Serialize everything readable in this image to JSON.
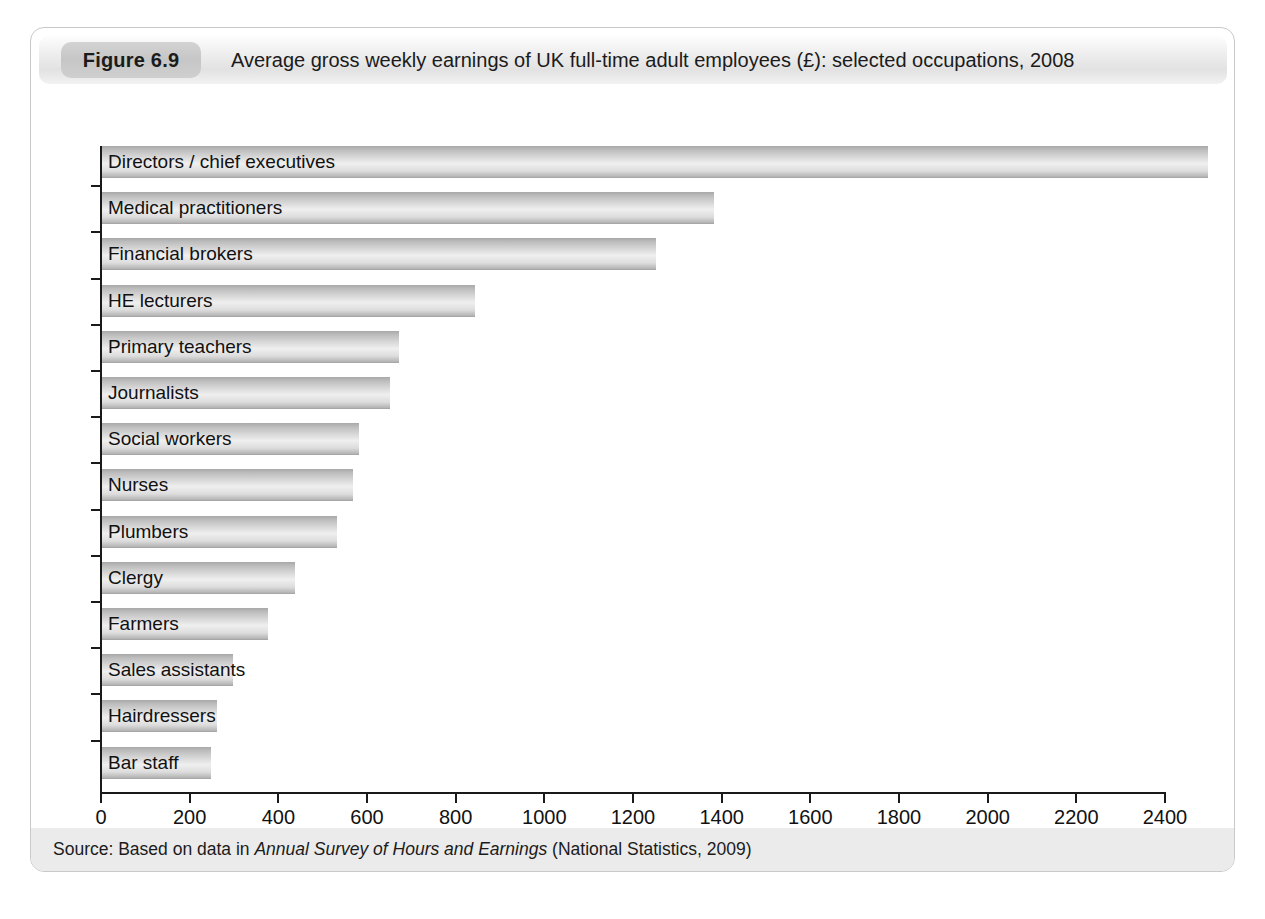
{
  "figure": {
    "number_label": "Figure 6.9",
    "title": "Average gross weekly earnings of UK full-time adult employees (£): selected occupations, 2008",
    "source_prefix": "Source: Based on data in ",
    "source_italic": "Annual Survey of Hours and Earnings",
    "source_suffix": " (National Statistics, 2009)"
  },
  "chart_data": {
    "type": "bar",
    "orientation": "horizontal",
    "title": "Average gross weekly earnings of UK full-time adult employees (£): selected occupations, 2008",
    "xlabel": "",
    "ylabel": "",
    "xlim": [
      0,
      2500
    ],
    "grid": false,
    "legend": "none",
    "xticks": [
      0,
      200,
      400,
      600,
      800,
      1000,
      1200,
      1400,
      1600,
      1800,
      2000,
      2200,
      2400
    ],
    "xtick_labels": [
      "0",
      "200",
      "400",
      "600",
      "800",
      "1000",
      "1200",
      "1400",
      "1600",
      "1800",
      "2000",
      "2200",
      "2400"
    ],
    "categories": [
      "Directors / chief executives",
      "Medical practitioners",
      "Financial brokers",
      "HE lecturers",
      "Primary teachers",
      "Journalists",
      "Social workers",
      "Nurses",
      "Plumbers",
      "Clergy",
      "Farmers",
      "Sales assistants",
      "Hairdressers",
      "Bar staff"
    ],
    "values": [
      2500,
      1385,
      1255,
      845,
      675,
      655,
      585,
      570,
      535,
      440,
      380,
      300,
      265,
      250
    ],
    "bar_color": "#d0d0d0",
    "units": "£ per week"
  }
}
